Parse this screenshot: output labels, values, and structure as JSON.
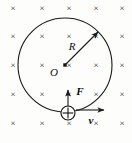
{
  "figure": {
    "background_color": "#fdfdfc",
    "ink_color": "#1a1a1a",
    "width": 132,
    "height": 143
  },
  "field": {
    "symbol": "×",
    "meaning": "magnetic-field-into-page",
    "rows": 5,
    "columns": 5,
    "marks": [
      {
        "x": 13,
        "y": 9
      },
      {
        "x": 42,
        "y": 9
      },
      {
        "x": 69,
        "y": 9
      },
      {
        "x": 96,
        "y": 9
      },
      {
        "x": 122,
        "y": 9
      },
      {
        "x": 13,
        "y": 37
      },
      {
        "x": 42,
        "y": 37
      },
      {
        "x": 69,
        "y": 37
      },
      {
        "x": 96,
        "y": 37
      },
      {
        "x": 122,
        "y": 37
      },
      {
        "x": 13,
        "y": 66
      },
      {
        "x": 42,
        "y": 66
      },
      {
        "x": 69,
        "y": 66
      },
      {
        "x": 96,
        "y": 66
      },
      {
        "x": 122,
        "y": 66
      },
      {
        "x": 13,
        "y": 95
      },
      {
        "x": 42,
        "y": 95
      },
      {
        "x": 69,
        "y": 95
      },
      {
        "x": 96,
        "y": 95
      },
      {
        "x": 122,
        "y": 95
      },
      {
        "x": 13,
        "y": 124
      },
      {
        "x": 42,
        "y": 124
      },
      {
        "x": 69,
        "y": 124
      },
      {
        "x": 96,
        "y": 124
      },
      {
        "x": 122,
        "y": 124
      }
    ]
  },
  "orbit": {
    "center_x": 65,
    "center_y": 65,
    "radius": 47
  },
  "center_marker": {
    "label": "O",
    "x": 65,
    "y": 65,
    "label_x": 54,
    "label_y": 73
  },
  "radius_vector": {
    "label": "R",
    "from_x": 65,
    "from_y": 65,
    "to_x": 98,
    "to_y": 32,
    "label_x": 72,
    "label_y": 47
  },
  "charge": {
    "symbol": "+",
    "sign": "positive",
    "x": 68,
    "y": 113,
    "radius": 7
  },
  "force_vector": {
    "label": "F",
    "from_x": 68,
    "from_y": 106,
    "to_x": 68,
    "to_y": 90,
    "label_x": 80,
    "label_y": 92
  },
  "velocity_vector": {
    "label": "v",
    "from_x": 76,
    "from_y": 110,
    "to_x": 104,
    "to_y": 110,
    "label_x": 91,
    "label_y": 121
  }
}
